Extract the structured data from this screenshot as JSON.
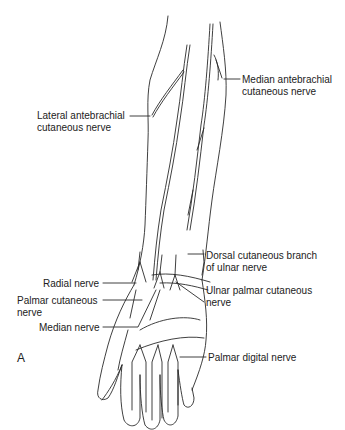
{
  "figure": {
    "panel_label": "A",
    "labels": {
      "median_antebrachial": [
        "Median antebrachial",
        "cutaneous nerve"
      ],
      "lateral_antebrachial": [
        "Lateral antebrachial",
        "cutaneous nerve"
      ],
      "dorsal_cutaneous_ulnar": [
        "Dorsal cutaneous branch",
        "of ulnar nerve"
      ],
      "radial_nerve": [
        "Radial nerve"
      ],
      "ulnar_palmar_cutaneous": [
        "Ulnar palmar cutaneous",
        "nerve"
      ],
      "palmar_cutaneous": [
        "Palmar cutaneous",
        "nerve"
      ],
      "median_nerve": [
        "Median nerve"
      ],
      "palmar_digital": [
        "Palmar digital nerve"
      ]
    },
    "colors": {
      "line": "#2a2a2a",
      "background": "#ffffff"
    }
  }
}
